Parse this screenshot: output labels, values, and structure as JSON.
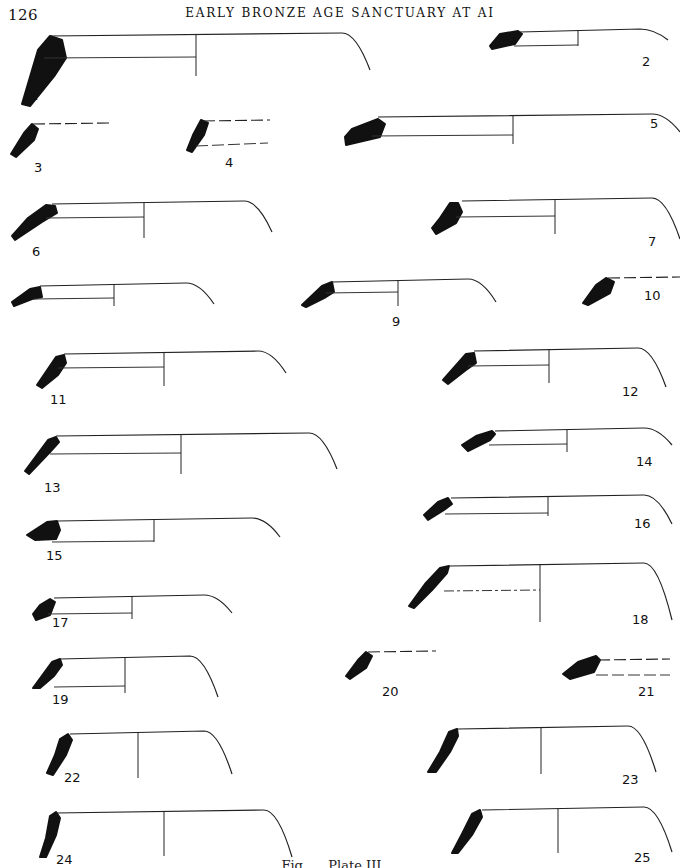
{
  "header": {
    "page_number": "126",
    "running_title": "EARLY BRONZE AGE SANCTUARY AT AI"
  },
  "figure": {
    "items": [
      {
        "id": "1",
        "label": "1",
        "type": "full-profile"
      },
      {
        "id": "2",
        "label": "2",
        "type": "full-profile"
      },
      {
        "id": "3",
        "label": "3",
        "type": "rim-fragment"
      },
      {
        "id": "4",
        "label": "4",
        "type": "rim-fragment"
      },
      {
        "id": "5",
        "label": "5",
        "type": "full-profile"
      },
      {
        "id": "6",
        "label": "6",
        "type": "full-profile"
      },
      {
        "id": "7",
        "label": "7",
        "type": "full-profile"
      },
      {
        "id": "8",
        "label": "",
        "type": "full-profile"
      },
      {
        "id": "9",
        "label": "9",
        "type": "full-profile"
      },
      {
        "id": "10",
        "label": "10",
        "type": "rim-fragment"
      },
      {
        "id": "11",
        "label": "11",
        "type": "full-profile"
      },
      {
        "id": "12",
        "label": "12",
        "type": "full-profile"
      },
      {
        "id": "13",
        "label": "13",
        "type": "full-profile"
      },
      {
        "id": "14",
        "label": "14",
        "type": "full-profile"
      },
      {
        "id": "15",
        "label": "15",
        "type": "full-profile"
      },
      {
        "id": "16",
        "label": "16",
        "type": "full-profile"
      },
      {
        "id": "17",
        "label": "17",
        "type": "full-profile"
      },
      {
        "id": "18",
        "label": "18",
        "type": "full-profile"
      },
      {
        "id": "19",
        "label": "19",
        "type": "full-profile"
      },
      {
        "id": "20",
        "label": "20",
        "type": "rim-fragment"
      },
      {
        "id": "21",
        "label": "21",
        "type": "rim-fragment"
      },
      {
        "id": "22",
        "label": "22",
        "type": "full-profile"
      },
      {
        "id": "23",
        "label": "23",
        "type": "full-profile"
      },
      {
        "id": "24",
        "label": "24",
        "type": "full-profile"
      },
      {
        "id": "25",
        "label": "25",
        "type": "full-profile"
      }
    ],
    "caption": "Fig. … Plate III …"
  }
}
